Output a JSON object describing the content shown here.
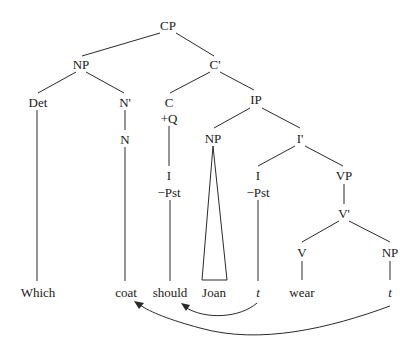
{
  "diagram": {
    "type": "syntax-tree",
    "nodes": {
      "cp": "CP",
      "np_spec": "NP",
      "c_bar": "C'",
      "det": "Det",
      "n_bar": "N'",
      "n": "N",
      "c": "C",
      "c_feature": "+Q",
      "c_i": "I",
      "c_i_feature": "−Pst",
      "ip": "IP",
      "np_subj": "NP",
      "i_bar": "I'",
      "i": "I",
      "i_feature": "−Pst",
      "vp": "VP",
      "v_bar": "V'",
      "v": "V",
      "np_obj": "NP"
    },
    "leaves": {
      "which": "Which",
      "coat": "coat",
      "should": "should",
      "joan": "Joan",
      "trace_i": "t",
      "wear": "wear",
      "trace_np": "t"
    },
    "movements": [
      {
        "from": "trace_i",
        "to": "should",
        "label": "I-to-C movement"
      },
      {
        "from": "trace_np",
        "to": "coat",
        "label": "wh-movement"
      }
    ]
  }
}
